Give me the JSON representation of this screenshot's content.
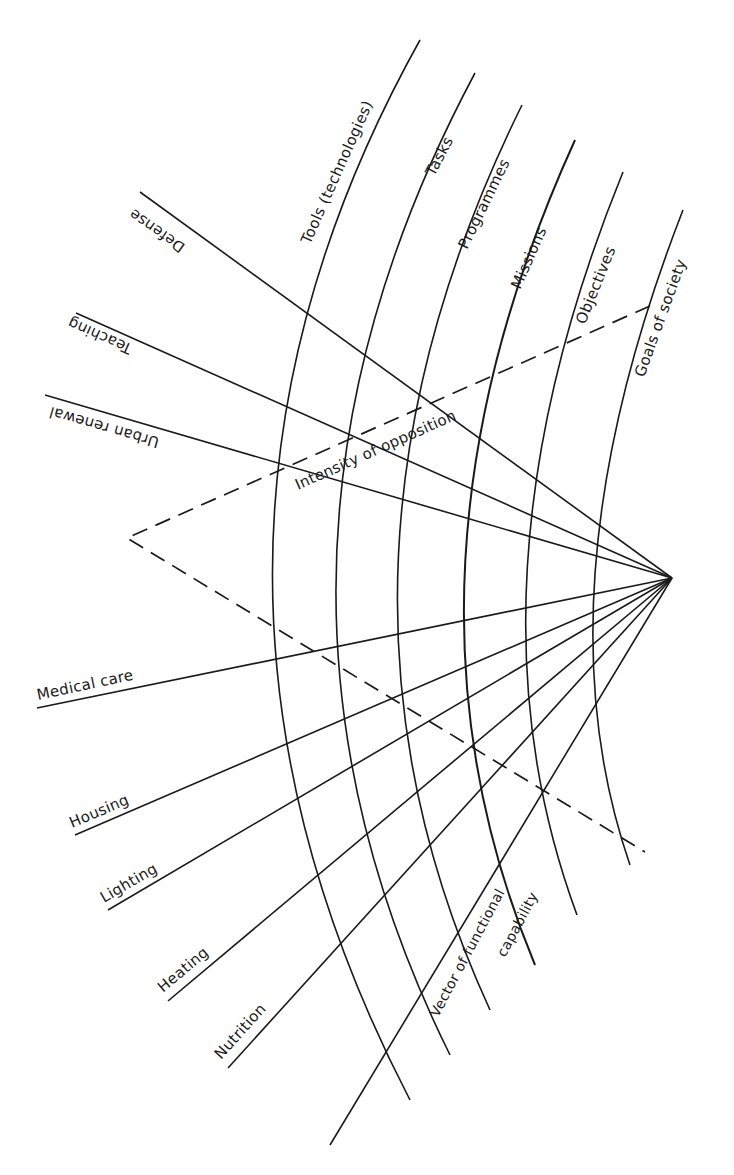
{
  "diagram": {
    "type": "radial-hierarchy-diagram",
    "focal_point": {
      "x": 672,
      "y": 578
    },
    "levels": [
      {
        "label": "Tools (technologies)",
        "order": 1
      },
      {
        "label": "Tasks",
        "order": 2
      },
      {
        "label": "Programmes",
        "order": 3
      },
      {
        "label": "Missions",
        "order": 4
      },
      {
        "label": "Objectives",
        "order": 5
      },
      {
        "label": "Goals of society",
        "order": 6
      }
    ],
    "functions": [
      {
        "label": "Defense"
      },
      {
        "label": "Teaching"
      },
      {
        "label": "Urban renewal"
      },
      {
        "label": "Medical care"
      },
      {
        "label": "Housing"
      },
      {
        "label": "Lighting"
      },
      {
        "label": "Heating"
      },
      {
        "label": "Nutrition"
      }
    ],
    "annotations": {
      "upper_dashed": "Intensity of opposition",
      "lower_axis_line1": "Vector of functional",
      "lower_axis_line2": "capability"
    },
    "colors": {
      "ink": "#1a1a1a",
      "background": "#ffffff"
    }
  }
}
